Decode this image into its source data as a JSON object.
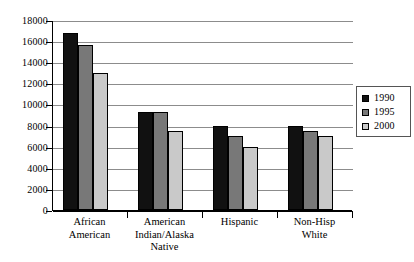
{
  "chart_data": {
    "type": "bar",
    "title": "",
    "xlabel": "",
    "ylabel": "",
    "ylim": [
      0,
      18000
    ],
    "ytick_step": 2000,
    "yticks": [
      "18000",
      "16000",
      "14000",
      "12000",
      "10000",
      "8000",
      "6000",
      "4000",
      "2000",
      "0"
    ],
    "grid": true,
    "legend_position": "right",
    "categories": [
      "African\nAmerican",
      "American\nIndian/Alaska\nNative",
      "Hispanic",
      "Non-Hisp\nWhite"
    ],
    "series": [
      {
        "name": "1990",
        "color": "#111111",
        "values": [
          16750,
          9300,
          8000,
          8000
        ]
      },
      {
        "name": "1995",
        "color": "#787878",
        "values": [
          15600,
          9300,
          7000,
          7500
        ]
      },
      {
        "name": "2000",
        "color": "#c9c9c9",
        "values": [
          13000,
          7500,
          6000,
          7000
        ]
      }
    ]
  },
  "legend": {
    "items": [
      {
        "label": "1990",
        "swatch": "#111111"
      },
      {
        "label": "1995",
        "swatch": "#787878"
      },
      {
        "label": "2000",
        "swatch": "#c9c9c9"
      }
    ]
  }
}
